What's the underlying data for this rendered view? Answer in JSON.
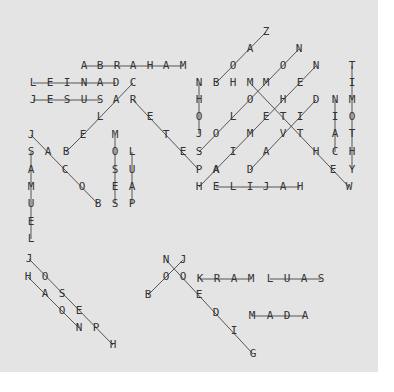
{
  "puzzle": {
    "type": "word-search",
    "background": "#e4e4e4",
    "line_color": "#555555",
    "letter_color": "#333333",
    "found_words": [
      "ABRAHAM",
      "DANIEL",
      "JESUS",
      "CALEB",
      "BOAZ",
      "SOLOMON",
      "NEHEMIAH",
      "DAVID",
      "MATTHEW",
      "TIMOTHY",
      "MICAH",
      "JOHN",
      "PETER",
      "ELIJAH",
      "JACOB",
      "SAMUEL",
      "MOSES",
      "PAUL",
      "ISAAC",
      "JOSEPH",
      "AARON",
      "JONAH",
      "BOB",
      "MARK",
      "SAUL",
      "GIDEON",
      "ADAM"
    ],
    "letters": [
      {
        "ch": "Z",
        "x": 266,
        "y": 32
      },
      {
        "ch": "A",
        "x": 250,
        "y": 49
      },
      {
        "ch": "O",
        "x": 233,
        "y": 66
      },
      {
        "ch": "B",
        "x": 216,
        "y": 83
      },
      {
        "ch": "N",
        "x": 299,
        "y": 49
      },
      {
        "ch": "O",
        "x": 283,
        "y": 66
      },
      {
        "ch": "M",
        "x": 266,
        "y": 83
      },
      {
        "ch": "O",
        "x": 250,
        "y": 100
      },
      {
        "ch": "L",
        "x": 233,
        "y": 117
      },
      {
        "ch": "O",
        "x": 216,
        "y": 134
      },
      {
        "ch": "S",
        "x": 199,
        "y": 152
      },
      {
        "ch": "N",
        "x": 316,
        "y": 66
      },
      {
        "ch": "E",
        "x": 300,
        "y": 83
      },
      {
        "ch": "H",
        "x": 283,
        "y": 100
      },
      {
        "ch": "E",
        "x": 266,
        "y": 117
      },
      {
        "ch": "M",
        "x": 250,
        "y": 134
      },
      {
        "ch": "I",
        "x": 233,
        "y": 152
      },
      {
        "ch": "A",
        "x": 216,
        "y": 170
      },
      {
        "ch": "H",
        "x": 199,
        "y": 187
      },
      {
        "ch": "D",
        "x": 316,
        "y": 100
      },
      {
        "ch": "I",
        "x": 300,
        "y": 117
      },
      {
        "ch": "V",
        "x": 283,
        "y": 134
      },
      {
        "ch": "A",
        "x": 266,
        "y": 152
      },
      {
        "ch": "D",
        "x": 250,
        "y": 170
      },
      {
        "ch": "M",
        "x": 250,
        "y": 83
      },
      {
        "ch": "T",
        "x": 283,
        "y": 117
      },
      {
        "ch": "T",
        "x": 300,
        "y": 134
      },
      {
        "ch": "H",
        "x": 316,
        "y": 152
      },
      {
        "ch": "E",
        "x": 333,
        "y": 170
      },
      {
        "ch": "W",
        "x": 349,
        "y": 187
      },
      {
        "ch": "H",
        "x": 233,
        "y": 83
      },
      {
        "ch": "T",
        "x": 352,
        "y": 66
      },
      {
        "ch": "I",
        "x": 352,
        "y": 83
      },
      {
        "ch": "M",
        "x": 352,
        "y": 100
      },
      {
        "ch": "O",
        "x": 352,
        "y": 117
      },
      {
        "ch": "T",
        "x": 352,
        "y": 134
      },
      {
        "ch": "H",
        "x": 352,
        "y": 152
      },
      {
        "ch": "Y",
        "x": 352,
        "y": 170
      },
      {
        "ch": "N",
        "x": 335,
        "y": 100
      },
      {
        "ch": "I",
        "x": 335,
        "y": 117
      },
      {
        "ch": "A",
        "x": 335,
        "y": 134
      },
      {
        "ch": "C",
        "x": 335,
        "y": 152
      },
      {
        "ch": "N",
        "x": 199,
        "y": 83
      },
      {
        "ch": "H",
        "x": 199,
        "y": 100
      },
      {
        "ch": "O",
        "x": 199,
        "y": 117
      },
      {
        "ch": "J",
        "x": 199,
        "y": 134
      },
      {
        "ch": "A",
        "x": 84,
        "y": 66
      },
      {
        "ch": "B",
        "x": 100,
        "y": 66
      },
      {
        "ch": "R",
        "x": 117,
        "y": 66
      },
      {
        "ch": "A",
        "x": 133,
        "y": 66
      },
      {
        "ch": "H",
        "x": 150,
        "y": 66
      },
      {
        "ch": "A",
        "x": 166,
        "y": 66
      },
      {
        "ch": "M",
        "x": 183,
        "y": 66
      },
      {
        "ch": "L",
        "x": 33,
        "y": 83
      },
      {
        "ch": "E",
        "x": 50,
        "y": 83
      },
      {
        "ch": "I",
        "x": 67,
        "y": 83
      },
      {
        "ch": "N",
        "x": 84,
        "y": 83
      },
      {
        "ch": "A",
        "x": 100,
        "y": 83
      },
      {
        "ch": "D",
        "x": 116,
        "y": 83
      },
      {
        "ch": "C",
        "x": 133,
        "y": 83
      },
      {
        "ch": "J",
        "x": 33,
        "y": 100
      },
      {
        "ch": "E",
        "x": 50,
        "y": 100
      },
      {
        "ch": "S",
        "x": 67,
        "y": 100
      },
      {
        "ch": "U",
        "x": 84,
        "y": 100
      },
      {
        "ch": "S",
        "x": 100,
        "y": 100
      },
      {
        "ch": "A",
        "x": 116,
        "y": 100
      },
      {
        "ch": "R",
        "x": 133,
        "y": 100
      },
      {
        "ch": "L",
        "x": 100,
        "y": 117
      },
      {
        "ch": "E",
        "x": 83,
        "y": 135
      },
      {
        "ch": "B",
        "x": 66,
        "y": 152
      },
      {
        "ch": "E",
        "x": 150,
        "y": 117
      },
      {
        "ch": "T",
        "x": 166,
        "y": 135
      },
      {
        "ch": "E",
        "x": 183,
        "y": 152
      },
      {
        "ch": "P",
        "x": 199,
        "y": 170
      },
      {
        "ch": "A",
        "x": 216,
        "y": 170
      },
      {
        "ch": "E",
        "x": 216,
        "y": 187
      },
      {
        "ch": "L",
        "x": 233,
        "y": 187
      },
      {
        "ch": "I",
        "x": 250,
        "y": 187
      },
      {
        "ch": "J",
        "x": 266,
        "y": 187
      },
      {
        "ch": "A",
        "x": 283,
        "y": 187
      },
      {
        "ch": "H",
        "x": 300,
        "y": 187
      },
      {
        "ch": "J",
        "x": 31,
        "y": 135
      },
      {
        "ch": "A",
        "x": 48,
        "y": 152
      },
      {
        "ch": "C",
        "x": 65,
        "y": 170
      },
      {
        "ch": "O",
        "x": 82,
        "y": 187
      },
      {
        "ch": "B",
        "x": 98,
        "y": 204
      },
      {
        "ch": "S",
        "x": 31,
        "y": 152
      },
      {
        "ch": "A",
        "x": 31,
        "y": 170
      },
      {
        "ch": "M",
        "x": 31,
        "y": 187
      },
      {
        "ch": "U",
        "x": 31,
        "y": 204
      },
      {
        "ch": "E",
        "x": 31,
        "y": 222
      },
      {
        "ch": "L",
        "x": 31,
        "y": 239
      },
      {
        "ch": "M",
        "x": 115,
        "y": 135
      },
      {
        "ch": "O",
        "x": 115,
        "y": 152
      },
      {
        "ch": "S",
        "x": 115,
        "y": 170
      },
      {
        "ch": "E",
        "x": 115,
        "y": 187
      },
      {
        "ch": "S",
        "x": 115,
        "y": 204
      },
      {
        "ch": "L",
        "x": 132,
        "y": 152
      },
      {
        "ch": "U",
        "x": 132,
        "y": 170
      },
      {
        "ch": "A",
        "x": 132,
        "y": 187
      },
      {
        "ch": "P",
        "x": 132,
        "y": 204
      },
      {
        "ch": "J",
        "x": 29,
        "y": 259
      },
      {
        "ch": "O",
        "x": 45,
        "y": 277
      },
      {
        "ch": "S",
        "x": 62,
        "y": 294
      },
      {
        "ch": "E",
        "x": 79,
        "y": 311
      },
      {
        "ch": "P",
        "x": 96,
        "y": 328
      },
      {
        "ch": "H",
        "x": 113,
        "y": 345
      },
      {
        "ch": "H",
        "x": 28,
        "y": 277
      },
      {
        "ch": "A",
        "x": 45,
        "y": 294
      },
      {
        "ch": "O",
        "x": 62,
        "y": 311
      },
      {
        "ch": "N",
        "x": 79,
        "y": 328
      },
      {
        "ch": "N",
        "x": 166,
        "y": 260
      },
      {
        "ch": "J",
        "x": 183,
        "y": 260
      },
      {
        "ch": "O",
        "x": 166,
        "y": 277
      },
      {
        "ch": "O",
        "x": 183,
        "y": 277
      },
      {
        "ch": "B",
        "x": 148,
        "y": 295
      },
      {
        "ch": "E",
        "x": 199,
        "y": 295
      },
      {
        "ch": "D",
        "x": 216,
        "y": 313
      },
      {
        "ch": "I",
        "x": 234,
        "y": 331
      },
      {
        "ch": "G",
        "x": 253,
        "y": 354
      },
      {
        "ch": "K",
        "x": 200,
        "y": 279
      },
      {
        "ch": "R",
        "x": 217,
        "y": 279
      },
      {
        "ch": "A",
        "x": 234,
        "y": 279
      },
      {
        "ch": "M",
        "x": 251,
        "y": 279
      },
      {
        "ch": "L",
        "x": 270,
        "y": 279
      },
      {
        "ch": "U",
        "x": 287,
        "y": 279
      },
      {
        "ch": "A",
        "x": 304,
        "y": 279
      },
      {
        "ch": "S",
        "x": 321,
        "y": 279
      },
      {
        "ch": "M",
        "x": 252,
        "y": 316
      },
      {
        "ch": "A",
        "x": 270,
        "y": 316
      },
      {
        "ch": "D",
        "x": 287,
        "y": 316
      },
      {
        "ch": "A",
        "x": 305,
        "y": 316
      }
    ],
    "lines": [
      [
        84,
        66,
        183,
        66
      ],
      [
        33,
        83,
        116,
        83
      ],
      [
        33,
        100,
        100,
        100
      ],
      [
        216,
        83,
        266,
        32
      ],
      [
        199,
        152,
        299,
        49
      ],
      [
        199,
        187,
        316,
        66
      ],
      [
        250,
        170,
        316,
        100
      ],
      [
        250,
        83,
        349,
        187
      ],
      [
        352,
        66,
        352,
        170
      ],
      [
        335,
        100,
        335,
        152
      ],
      [
        199,
        83,
        199,
        134
      ],
      [
        133,
        83,
        83,
        135
      ],
      [
        83,
        135,
        66,
        152
      ],
      [
        133,
        100,
        199,
        170
      ],
      [
        216,
        187,
        300,
        187
      ],
      [
        31,
        135,
        98,
        204
      ],
      [
        31,
        152,
        31,
        239
      ],
      [
        115,
        135,
        115,
        204
      ],
      [
        132,
        152,
        132,
        204
      ],
      [
        29,
        259,
        113,
        345
      ],
      [
        28,
        277,
        79,
        328
      ],
      [
        148,
        295,
        183,
        260
      ],
      [
        166,
        260,
        253,
        354
      ],
      [
        200,
        279,
        251,
        279
      ],
      [
        270,
        279,
        321,
        279
      ],
      [
        252,
        316,
        305,
        316
      ]
    ]
  }
}
